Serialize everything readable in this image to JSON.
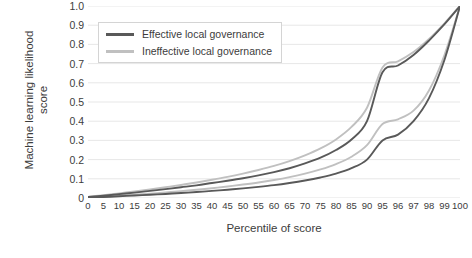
{
  "chart_data": {
    "type": "line",
    "title": "",
    "xlabel": "Percentile of score",
    "ylabel_line1": "Machine learning likelihood",
    "ylabel_line2": "score",
    "xlim": [
      0,
      100
    ],
    "ylim": [
      0,
      1.0
    ],
    "grid": "horizontal",
    "legend_position": "upper-left-inside",
    "x_tick_labels": [
      "0",
      "5",
      "10",
      "15",
      "20",
      "25",
      "30",
      "35",
      "40",
      "45",
      "50",
      "55",
      "60",
      "65",
      "70",
      "75",
      "80",
      "85",
      "90",
      "95",
      "96",
      "97",
      "98",
      "99",
      "100"
    ],
    "x_tick_values": [
      0,
      5,
      10,
      15,
      20,
      25,
      30,
      35,
      40,
      45,
      50,
      55,
      60,
      65,
      70,
      75,
      80,
      85,
      90,
      95,
      96,
      97,
      98,
      99,
      100
    ],
    "y_tick_labels": [
      "0",
      "0.1",
      "0.2",
      "0.3",
      "0.4",
      "0.5",
      "0.6",
      "0.7",
      "0.8",
      "0.9",
      "1.0"
    ],
    "y_tick_values": [
      0,
      0.1,
      0.2,
      0.3,
      0.4,
      0.5,
      0.6,
      0.7,
      0.8,
      0.9,
      1.0
    ],
    "colors": {
      "effective": "#595959",
      "ineffective": "#c0c0c0",
      "grid": "#e4e4e4",
      "text": "#3c3c3c"
    },
    "legend": [
      {
        "label": "Effective local governance",
        "color": "#595959"
      },
      {
        "label": "Ineffective local governance",
        "color": "#c0c0c0"
      }
    ],
    "series": [
      {
        "name": "Effective local governance (upper)",
        "color": "#595959",
        "x": [
          0,
          5,
          10,
          15,
          20,
          25,
          30,
          35,
          40,
          45,
          50,
          55,
          60,
          65,
          70,
          75,
          80,
          85,
          90,
          95,
          96,
          97,
          98,
          99,
          100
        ],
        "values": [
          0.005,
          0.012,
          0.02,
          0.028,
          0.037,
          0.046,
          0.056,
          0.066,
          0.078,
          0.09,
          0.103,
          0.118,
          0.135,
          0.155,
          0.18,
          0.21,
          0.25,
          0.305,
          0.4,
          0.655,
          0.69,
          0.745,
          0.82,
          0.905,
          1.0
        ]
      },
      {
        "name": "Ineffective local governance (upper)",
        "color": "#c0c0c0",
        "x": [
          0,
          5,
          10,
          15,
          20,
          25,
          30,
          35,
          40,
          45,
          50,
          55,
          60,
          65,
          70,
          75,
          80,
          85,
          90,
          95,
          96,
          97,
          98,
          99,
          100
        ],
        "values": [
          0.006,
          0.014,
          0.024,
          0.034,
          0.045,
          0.056,
          0.068,
          0.081,
          0.095,
          0.11,
          0.127,
          0.146,
          0.167,
          0.192,
          0.222,
          0.258,
          0.305,
          0.37,
          0.47,
          0.68,
          0.712,
          0.76,
          0.828,
          0.91,
          1.0
        ]
      },
      {
        "name": "Effective local governance (lower)",
        "color": "#595959",
        "x": [
          0,
          5,
          10,
          15,
          20,
          25,
          30,
          35,
          40,
          45,
          50,
          55,
          60,
          65,
          70,
          75,
          80,
          85,
          90,
          95,
          96,
          97,
          98,
          99,
          100
        ],
        "values": [
          0.002,
          0.005,
          0.009,
          0.013,
          0.017,
          0.021,
          0.026,
          0.031,
          0.037,
          0.043,
          0.05,
          0.058,
          0.067,
          0.078,
          0.091,
          0.107,
          0.127,
          0.155,
          0.2,
          0.3,
          0.33,
          0.4,
          0.52,
          0.72,
          1.0
        ]
      },
      {
        "name": "Ineffective local governance (lower)",
        "color": "#c0c0c0",
        "x": [
          0,
          5,
          10,
          15,
          20,
          25,
          30,
          35,
          40,
          45,
          50,
          55,
          60,
          65,
          70,
          75,
          80,
          85,
          90,
          95,
          96,
          97,
          98,
          99,
          100
        ],
        "values": [
          0.003,
          0.007,
          0.012,
          0.017,
          0.023,
          0.029,
          0.036,
          0.043,
          0.051,
          0.06,
          0.07,
          0.081,
          0.094,
          0.109,
          0.127,
          0.149,
          0.177,
          0.215,
          0.275,
          0.385,
          0.41,
          0.455,
          0.56,
          0.745,
          1.0
        ]
      }
    ]
  }
}
